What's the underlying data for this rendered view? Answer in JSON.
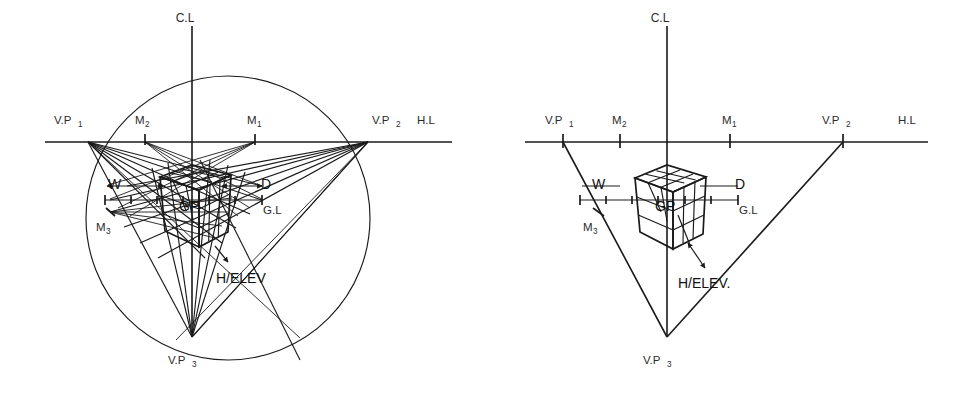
{
  "figure": {
    "background_color": "#ffffff",
    "line_color": "#1a1a1a",
    "text_color": "#2b2b2b"
  },
  "diagrams": [
    {
      "id": "left-construction",
      "name": "construction-with-measuring-points",
      "description": "Full three-point perspective construction showing station circle, all measuring rays and the cube",
      "has_circle": true,
      "labels": {
        "center_line": "C.L",
        "horizon_line": "H.L",
        "ground_line": "G.L",
        "ground_point": "GP",
        "vanishing_point_1": "V.P",
        "vanishing_point_1_sub": "1",
        "vanishing_point_2": "V.P",
        "vanishing_point_2_sub": "2",
        "vanishing_point_3": "V.P",
        "vanishing_point_3_sub": "3",
        "measuring_point_1": "M",
        "measuring_point_1_sub": "1",
        "measuring_point_2": "M",
        "measuring_point_2_sub": "2",
        "measuring_point_3": "M",
        "measuring_point_3_sub": "3",
        "width_label": "W",
        "depth_label": "D",
        "height_label": "H/ELEV"
      }
    },
    {
      "id": "right-result",
      "name": "finished-cube-in-triangle",
      "description": "Resulting three-point perspective cube inside the vanishing point triangle",
      "has_circle": false,
      "labels": {
        "center_line": "C.L",
        "horizon_line": "H.L",
        "ground_line": "G.L",
        "ground_point": "GP",
        "vanishing_point_1": "V.P",
        "vanishing_point_1_sub": "1",
        "vanishing_point_2": "V.P",
        "vanishing_point_2_sub": "2",
        "vanishing_point_3": "V.P",
        "vanishing_point_3_sub": "3",
        "measuring_point_1": "M",
        "measuring_point_1_sub": "1",
        "measuring_point_2": "M",
        "measuring_point_2_sub": "2",
        "measuring_point_3": "M",
        "measuring_point_3_sub": "3",
        "width_label": "W",
        "depth_label": "D",
        "height_label": "H/ELEV."
      }
    }
  ],
  "geometry": {
    "left": {
      "horizon_y": 142,
      "ground_y": 200,
      "center_x": 192,
      "vp1_x": 88,
      "vp2_x": 368,
      "vp3": [
        192,
        337
      ],
      "m1_x": 255,
      "m2_x": 145,
      "m3": [
        110,
        212
      ],
      "circle_center": [
        228,
        218
      ],
      "circle_radius": 142
    },
    "right": {
      "horizon_y": 142,
      "ground_y": 200,
      "center_x": 667,
      "vp1_x": 563,
      "vp2_x": 843,
      "vp3": [
        667,
        337
      ],
      "m1_x": 730,
      "m2_x": 620,
      "m3": [
        598,
        212
      ]
    }
  }
}
